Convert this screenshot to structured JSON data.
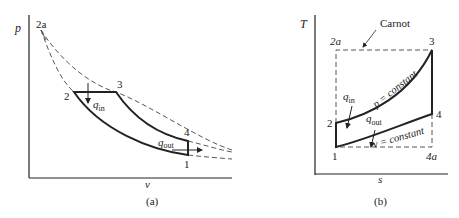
{
  "diagram_a": {
    "caption": "(a)",
    "y_axis_label": "p",
    "x_axis_label": "v",
    "points": {
      "p2a": "2a",
      "p2": "2",
      "p3": "3",
      "p4": "4",
      "p1": "1"
    },
    "heat_in": {
      "q": "q",
      "sub": "in"
    },
    "heat_out": {
      "q": "q",
      "sub": "out"
    }
  },
  "diagram_b": {
    "caption": "(b)",
    "y_axis_label": "T",
    "x_axis_label": "s",
    "carnot_label": "Carnot",
    "points": {
      "p2a": "2a",
      "p3": "3",
      "p2": "2",
      "p4": "4",
      "p1": "1",
      "p4a": "4a"
    },
    "heat_in": {
      "q": "q",
      "sub": "in"
    },
    "heat_out": {
      "q": "q",
      "sub": "out"
    },
    "upper_curve_label": "p = constant",
    "lower_curve_label": "v = constant"
  },
  "colors": {
    "line": "#222222",
    "dashed": "#444444",
    "background": "#ffffff"
  }
}
